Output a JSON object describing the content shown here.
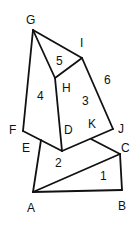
{
  "diagram": {
    "title": "",
    "stroke_color": "#111111",
    "background": "#ffffff",
    "vertices": {
      "G": [
        33,
        30
      ],
      "I": [
        82,
        58
      ],
      "H": [
        55,
        78
      ],
      "F": [
        23,
        131
      ],
      "E": [
        41,
        140
      ],
      "D": [
        62,
        151
      ],
      "K": [
        91,
        139
      ],
      "J": [
        113,
        129
      ],
      "C": [
        120,
        154
      ],
      "A": [
        33,
        192
      ],
      "B": [
        122,
        190
      ]
    },
    "edges": [
      [
        "G",
        "I"
      ],
      [
        "G",
        "H"
      ],
      [
        "H",
        "I"
      ],
      [
        "G",
        "F"
      ],
      [
        "H",
        "D"
      ],
      [
        "I",
        "J"
      ],
      [
        "F",
        "D"
      ],
      [
        "D",
        "J"
      ],
      [
        "K",
        "C"
      ],
      [
        "E",
        "A"
      ],
      [
        "A",
        "C"
      ],
      [
        "A",
        "B"
      ],
      [
        "B",
        "C"
      ]
    ],
    "point_labels": [
      {
        "text": "G",
        "x": 26,
        "y": 24
      },
      {
        "text": "I",
        "x": 80,
        "y": 47
      },
      {
        "text": "H",
        "x": 62,
        "y": 92
      },
      {
        "text": "F",
        "x": 9,
        "y": 134
      },
      {
        "text": "E",
        "x": 22,
        "y": 152
      },
      {
        "text": "D",
        "x": 64,
        "y": 134
      },
      {
        "text": "K",
        "x": 88,
        "y": 128
      },
      {
        "text": "J",
        "x": 118,
        "y": 133
      },
      {
        "text": "C",
        "x": 121,
        "y": 152
      },
      {
        "text": "A",
        "x": 27,
        "y": 212
      },
      {
        "text": "B",
        "x": 118,
        "y": 210
      }
    ],
    "region_labels": [
      {
        "text": "1",
        "x": 100,
        "y": 180
      },
      {
        "text": "2",
        "x": 55,
        "y": 167
      },
      {
        "text": "3",
        "x": 82,
        "y": 105
      },
      {
        "text": "4",
        "x": 37,
        "y": 100
      },
      {
        "text": "5",
        "x": 56,
        "y": 65
      },
      {
        "text": "6",
        "x": 104,
        "y": 84
      }
    ]
  }
}
